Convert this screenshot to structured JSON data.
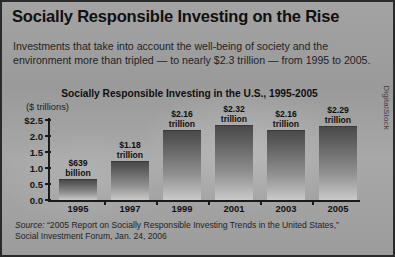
{
  "headline": "Socially Responsible Investing on the Rise",
  "deck": "Investments that take into account the well-being of society and the environment more than tripled — to nearly $2.3 trillion — from 1995 to 2005.",
  "chart_title": "Socially Responsible Investing in the U.S., 1995-2005",
  "axis_unit": "($ trillions)",
  "source": {
    "lead": "Source:",
    "text": " “2005 Report on Socially Responsible Investing Trends in the United States,” Social Investment Forum, Jan. 24, 2006"
  },
  "credit": "DigitalStock",
  "colors": {
    "panel_background": "#9d9d9d",
    "panel_border": "#2a2a2a",
    "bar_top": "#4a4a4a",
    "bar_bottom": "#c9c9c9",
    "axis": "#1a1a1a",
    "text": "#101010"
  },
  "chart_data": {
    "type": "bar",
    "title": "Socially Responsible Investing in the U.S., 1995-2005",
    "xlabel": "",
    "ylabel": "($ trillions)",
    "ylim": [
      0.0,
      2.5
    ],
    "grid": false,
    "legend": null,
    "categories": [
      "1995",
      "1997",
      "1999",
      "2001",
      "2003",
      "2005"
    ],
    "values": [
      0.639,
      1.18,
      2.16,
      2.32,
      2.16,
      2.29
    ],
    "value_labels": [
      "$639\nbillion",
      "$1.18\ntrillion",
      "$2.16\ntrillion",
      "$2.32\ntrillion",
      "$2.16\ntrillion",
      "$2.29\ntrillion"
    ],
    "ytick_values": [
      0.0,
      0.5,
      1.0,
      1.5,
      2.0,
      2.5
    ],
    "ytick_labels": [
      "0.0",
      "0.5",
      "1.0",
      "1.5",
      "2.0",
      "$2.5"
    ]
  }
}
